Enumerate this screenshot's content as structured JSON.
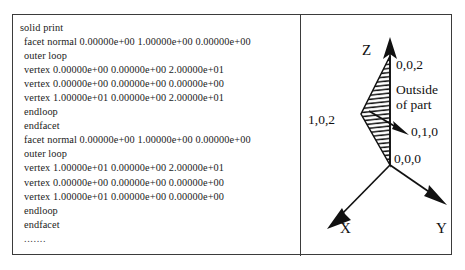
{
  "figure": {
    "background_color": "#ffffff",
    "border_color": "#3b3b3b"
  },
  "stl_listing": {
    "title": "stl-ascii-listing",
    "lines": [
      "solid print",
      "facet normal 0.00000e+00 1.00000e+00 0.00000e+00",
      "outer loop",
      "vertex 0.00000e+00 0.00000e+00 2.00000e+01",
      "vertex 0.00000e+00 0.00000e+00 0.00000e+00",
      "vertex 1.00000e+01 0.00000e+00 2.00000e+01",
      "endloop",
      "endfacet",
      "facet normal 0.00000e+00 1.00000e+00 0.00000e+00",
      "outer loop",
      "vertex 1.00000e+01 0.00000e+00 2.00000e+01",
      "vertex 0.00000e+00 0.00000e+00 0.00000e+00",
      "vertex 1.00000e+01 0.00000e+00 0.00000e+00",
      "endloop",
      "endfacet",
      "......."
    ]
  },
  "diagram": {
    "axis_labels": {
      "z": "Z",
      "x": "X",
      "y": "Y"
    },
    "vertex_labels": {
      "top": "0,0,2",
      "left": "1,0,2",
      "origin": "0,0,0"
    },
    "normal_label": "0,1,0",
    "outside_note_line1": "Outside",
    "outside_note_line2": "of part",
    "line_color": "#111111",
    "hatch_color": "#111111"
  }
}
